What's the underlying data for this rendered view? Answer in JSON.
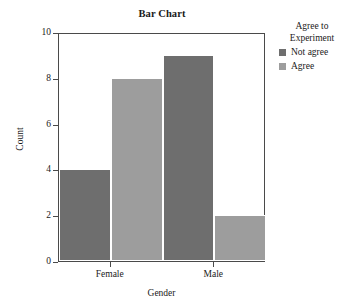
{
  "chart_data": {
    "type": "bar",
    "title": "Bar Chart",
    "xlabel": "Gender",
    "ylabel": "Count",
    "categories": [
      "Female",
      "Male"
    ],
    "series": [
      {
        "name": "Not agree",
        "values": [
          4,
          9
        ],
        "color": "#6e6e6e"
      },
      {
        "name": "Agree",
        "values": [
          8,
          2
        ],
        "color": "#9d9d9d"
      }
    ],
    "ylim": [
      0,
      10
    ],
    "yticks": [
      0,
      2,
      4,
      6,
      8,
      10
    ],
    "ytick_labels": [
      "0",
      "2",
      "4",
      "6",
      "8",
      "10"
    ],
    "grid": false,
    "legend_position": "right",
    "legend_title": "Agree to Experiment",
    "legend_title_lines": [
      "Agree to",
      "Experiment"
    ]
  },
  "legend": {
    "title_line1": "Agree to",
    "title_line2": "Experiment",
    "items": [
      {
        "label": "Not agree",
        "color": "#6e6e6e"
      },
      {
        "label": "Agree",
        "color": "#9d9d9d"
      }
    ]
  },
  "colors": {
    "not_agree": "#6e6e6e",
    "agree": "#9d9d9d",
    "axis": "#4a4a4a",
    "text": "#1a1a1a",
    "background": "#ffffff"
  }
}
